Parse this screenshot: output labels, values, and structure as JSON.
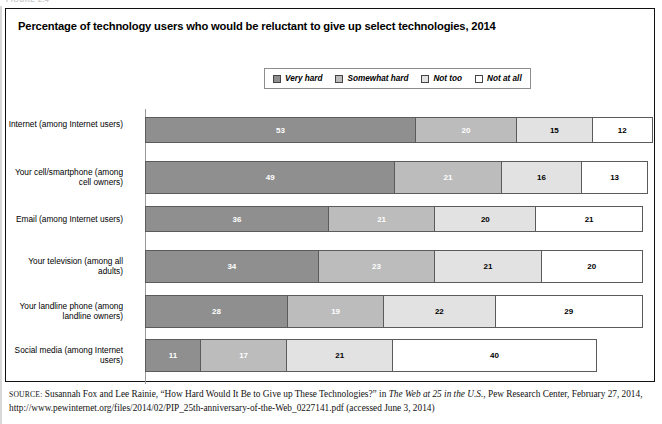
{
  "figure": {
    "title": "Percentage of technology users who would be reluctant to give up select technologies, 2014",
    "top_cut_text": "FIGURE 2.4"
  },
  "legend": {
    "position": "top-center",
    "items": [
      {
        "label": "Very hard",
        "color": "#8f8f8f",
        "icon": "legend-swatch-icon"
      },
      {
        "label": "Somewhat hard",
        "color": "#bcbcbc",
        "icon": "legend-swatch-icon"
      },
      {
        "label": "Not too",
        "color": "#e2e2e2",
        "icon": "legend-swatch-icon"
      },
      {
        "label": "Not at all",
        "color": "#ffffff",
        "icon": "legend-swatch-icon"
      }
    ]
  },
  "source": {
    "label": "SOURCE:",
    "text_part1": " Susannah Fox and Lee Rainie, “How Hard Would It Be to Give up These Technologies?” in ",
    "italic1": "The Web at 25 in the U.S.",
    "text_part2": ", Pew Research Center, February 27, 2014, http://www.pewinternet.org/files/2014/02/PIP_25th-anniversary-of-the-Web_0227141.pdf (accessed June 3, 2014)"
  },
  "chart_data": {
    "type": "bar",
    "orientation": "horizontal",
    "stacked": true,
    "title": "Percentage of technology users who would be reluctant to give up select technologies, 2014",
    "xlabel": "",
    "ylabel": "",
    "xlim": [
      0,
      100
    ],
    "grid": false,
    "legend_position": "top-center",
    "categories": [
      "Internet (among Internet users)",
      "Your cell/smartphone (among cell owners)",
      "Email (among Internet users)",
      "Your television (among all adults)",
      "Your landline phone (among landline owners)",
      "Social media (among Internet users)"
    ],
    "series": [
      {
        "name": "Very hard",
        "color": "#8f8f8f",
        "values": [
          53,
          49,
          36,
          34,
          28,
          11
        ]
      },
      {
        "name": "Somewhat hard",
        "color": "#bcbcbc",
        "values": [
          20,
          21,
          21,
          23,
          19,
          17
        ]
      },
      {
        "name": "Not too",
        "color": "#e2e2e2",
        "values": [
          15,
          16,
          20,
          21,
          22,
          21
        ]
      },
      {
        "name": "Not at all",
        "color": "#ffffff",
        "values": [
          12,
          13,
          21,
          20,
          29,
          40
        ]
      }
    ]
  }
}
